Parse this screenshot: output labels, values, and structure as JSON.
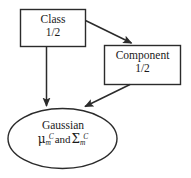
{
  "diagram": {
    "type": "flow-diagram",
    "background_color": "#ffffff",
    "stroke_color": "#2b2b2b",
    "fill_color": "#ffffff",
    "nodes": [
      {
        "id": "class",
        "shape": "rectangle",
        "label_line1": "Class",
        "label_line2": "1/2"
      },
      {
        "id": "component",
        "shape": "rectangle",
        "label_line1": "Component",
        "label_line2": "1/2"
      },
      {
        "id": "gaussian",
        "shape": "ellipse",
        "label_line1": "Gaussian",
        "math": {
          "mu": "μ",
          "mu_sub": "m",
          "mu_sup": "C",
          "conjunction": "and",
          "sigma": "Σ",
          "sigma_sub": "m",
          "sigma_sup": "C"
        }
      }
    ],
    "edges": [
      {
        "id": "class-to-component",
        "from": "class",
        "to": "component",
        "arrowhead": "filled-triangle"
      },
      {
        "id": "class-to-gaussian",
        "from": "class",
        "to": "gaussian",
        "arrowhead": "filled-triangle"
      },
      {
        "id": "component-to-gaussian",
        "from": "component",
        "to": "gaussian",
        "arrowhead": "filled-triangle"
      }
    ]
  }
}
